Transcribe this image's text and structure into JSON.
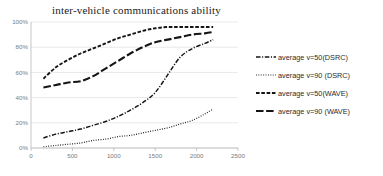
{
  "chart_data": {
    "type": "line",
    "title": "inter-vehicle communications ability",
    "xlabel": "",
    "ylabel": "",
    "xlim": [
      0,
      2500
    ],
    "ylim": [
      0,
      1.0
    ],
    "grid": true,
    "legend_position": "right",
    "xticks": [
      "0",
      "500",
      "1000",
      "1500",
      "2000",
      "2500"
    ],
    "xtick_values": [
      0,
      500,
      1000,
      1500,
      2000,
      2500
    ],
    "yticks": [
      "0%",
      "20%",
      "40%",
      "60%",
      "80%",
      "100%"
    ],
    "ytick_values": [
      0,
      20,
      40,
      60,
      80,
      100
    ],
    "series": [
      {
        "name": "average v=50(DSRC)",
        "style": "dash-dot",
        "x": [
          150,
          300,
          450,
          600,
          750,
          900,
          1050,
          1200,
          1350,
          1500,
          1650,
          1800,
          1950,
          2100,
          2200
        ],
        "values": [
          8,
          11,
          13,
          15,
          18,
          21,
          25,
          30,
          36,
          44,
          58,
          72,
          79,
          83,
          86
        ]
      },
      {
        "name": "average v=90 (DSRC)",
        "style": "dotted",
        "x": [
          150,
          300,
          450,
          600,
          750,
          900,
          1050,
          1200,
          1350,
          1500,
          1650,
          1800,
          1950,
          2100,
          2200
        ],
        "values": [
          1,
          2,
          3,
          4,
          6,
          7,
          9,
          10,
          12,
          14,
          16,
          19,
          22,
          27,
          31
        ]
      },
      {
        "name": "average v=50(WAVE)",
        "style": "short-dash",
        "x": [
          150,
          300,
          450,
          600,
          750,
          900,
          1050,
          1200,
          1350,
          1500,
          1650,
          1800,
          1950,
          2100,
          2200
        ],
        "values": [
          55,
          64,
          70,
          75,
          79,
          83,
          87,
          90,
          93,
          95,
          96,
          96,
          96,
          96,
          96
        ]
      },
      {
        "name": "average v=90 (WAVE)",
        "style": "long-dash",
        "x": [
          150,
          300,
          450,
          600,
          750,
          900,
          1050,
          1200,
          1350,
          1500,
          1650,
          1800,
          1950,
          2100,
          2200
        ],
        "values": [
          48,
          50,
          52,
          53,
          57,
          63,
          69,
          75,
          80,
          84,
          86,
          88,
          90,
          91,
          92
        ]
      }
    ]
  },
  "legend": {
    "items": [
      {
        "label": "average v=50(DSRC)",
        "style": "dash-dot"
      },
      {
        "label": "average v=90 (DSRC)",
        "style": "dotted"
      },
      {
        "label": "average v=50(WAVE)",
        "style": "short-dash"
      },
      {
        "label": "average v=90 (WAVE)",
        "style": "long-dash"
      }
    ]
  },
  "colors": {
    "series": "#151515",
    "grid": "#d9d9d9",
    "axis": "#b0b0b0",
    "tick_text": "#7b7b7b",
    "title_text": "#1a1a1a",
    "background": "#ffffff"
  }
}
